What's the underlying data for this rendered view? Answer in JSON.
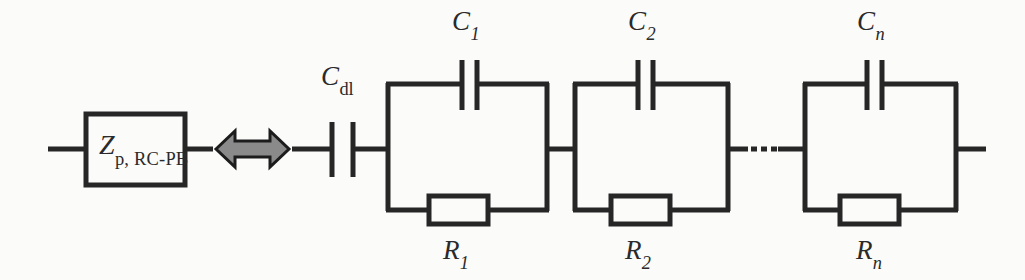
{
  "diagram": {
    "colors": {
      "background": "#fbfbfa",
      "line": "#262626",
      "arrow_fill": "#8a8a8a",
      "arrow_stroke": "#1c1c1c",
      "text": "#2a2a2a"
    },
    "left_element": {
      "type": "impedance-block",
      "symbol": "Z",
      "subscript": "p, RC-PB",
      "full_label": "Zp, RC-PB"
    },
    "equivalence_symbol": {
      "name": "double-headed-arrow",
      "meaning": "is equivalent to"
    },
    "series_capacitor": {
      "symbol": "C",
      "subscript": "dl",
      "full_label": "Cdl"
    },
    "rc_blocks": [
      {
        "capacitor": {
          "symbol": "C",
          "subscript": "1",
          "full_label": "C1"
        },
        "resistor": {
          "symbol": "R",
          "subscript": "1",
          "full_label": "R1"
        }
      },
      {
        "capacitor": {
          "symbol": "C",
          "subscript": "2",
          "full_label": "C2"
        },
        "resistor": {
          "symbol": "R",
          "subscript": "2",
          "full_label": "R2"
        }
      },
      {
        "capacitor": {
          "symbol": "C",
          "subscript": "n",
          "full_label": "Cn"
        },
        "resistor": {
          "symbol": "R",
          "subscript": "n",
          "full_label": "Rn"
        }
      }
    ],
    "continuation": {
      "name": "ellipsis",
      "glyph": "…",
      "meaning": "repeating RC sections omitted"
    }
  }
}
